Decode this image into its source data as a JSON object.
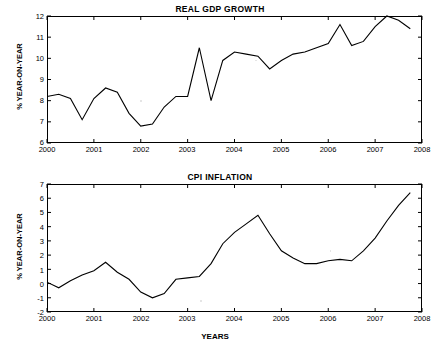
{
  "chart_data": [
    {
      "type": "line",
      "title": "REAL GDP GROWTH",
      "xlabel": "",
      "ylabel": "% YEAR-ON-YEAR",
      "xlim": [
        2000,
        2008
      ],
      "ylim": [
        6,
        12
      ],
      "xticks": [
        "2000",
        "2001",
        "2002",
        "2003",
        "2004",
        "2005",
        "2006",
        "2007",
        "2008"
      ],
      "yticks": [
        "6",
        "7",
        "8",
        "9",
        "10",
        "11",
        "12"
      ],
      "grid": false,
      "legend": "none",
      "series": [
        {
          "name": "Real GDP growth",
          "x": [
            2000.0,
            2000.25,
            2000.5,
            2000.75,
            2001.0,
            2001.25,
            2001.5,
            2001.75,
            2002.0,
            2002.25,
            2002.5,
            2002.75,
            2003.0,
            2003.25,
            2003.5,
            2003.75,
            2004.0,
            2004.25,
            2004.5,
            2004.75,
            2005.0,
            2005.25,
            2005.5,
            2005.75,
            2006.0,
            2006.25,
            2006.5,
            2006.75,
            2007.0,
            2007.25,
            2007.5,
            2007.75
          ],
          "values": [
            8.2,
            8.3,
            8.1,
            7.1,
            8.1,
            8.6,
            8.4,
            7.4,
            6.8,
            6.9,
            7.7,
            8.2,
            8.2,
            10.5,
            8.0,
            9.9,
            10.3,
            10.2,
            10.1,
            9.5,
            9.9,
            10.2,
            10.3,
            10.5,
            10.7,
            11.6,
            10.6,
            10.8,
            11.5,
            12.0,
            11.8,
            11.4
          ],
          "color": "#000000"
        }
      ]
    },
    {
      "type": "line",
      "title": "CPI INFLATION",
      "xlabel": "YEARS",
      "ylabel": "% YEAR-ON-YEAR",
      "xlim": [
        2000,
        2008
      ],
      "ylim": [
        -2,
        7
      ],
      "xticks": [
        "2000",
        "2001",
        "2002",
        "2003",
        "2004",
        "2005",
        "2006",
        "2007",
        "2008"
      ],
      "yticks": [
        "-2",
        "-1",
        "0",
        "1",
        "2",
        "3",
        "4",
        "5",
        "6",
        "7"
      ],
      "grid": false,
      "legend": "none",
      "series": [
        {
          "name": "CPI inflation",
          "x": [
            2000.0,
            2000.25,
            2000.5,
            2000.75,
            2001.0,
            2001.25,
            2001.5,
            2001.75,
            2002.0,
            2002.25,
            2002.5,
            2002.75,
            2003.0,
            2003.25,
            2003.5,
            2003.75,
            2004.0,
            2004.25,
            2004.5,
            2004.75,
            2005.0,
            2005.25,
            2005.5,
            2005.75,
            2006.0,
            2006.25,
            2006.5,
            2006.75,
            2007.0,
            2007.25,
            2007.5,
            2007.75
          ],
          "values": [
            0.1,
            -0.3,
            0.2,
            0.6,
            0.9,
            1.5,
            0.8,
            0.3,
            -0.6,
            -1.0,
            -0.7,
            0.3,
            0.4,
            0.5,
            1.4,
            2.8,
            3.6,
            4.2,
            4.8,
            3.5,
            2.3,
            1.8,
            1.4,
            1.4,
            1.6,
            1.7,
            1.6,
            2.3,
            3.2,
            4.4,
            5.5,
            6.4
          ],
          "color": "#000000"
        }
      ]
    }
  ],
  "top_chart": {
    "title": "REAL GDP GROWTH",
    "ylabel": "% YEAR-ON-YEAR"
  },
  "bottom_chart": {
    "title": "CPI INFLATION",
    "ylabel": "% YEAR-ON-YEAR",
    "xlabel": "YEARS"
  }
}
